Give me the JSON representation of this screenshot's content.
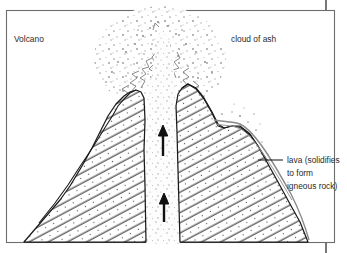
{
  "diagram": {
    "title_label": "Volcano",
    "ash_label": "cloud of ash",
    "lava_label_line1": "lava (solidifies",
    "lava_label_line2": "to form",
    "lava_label_line3": "igneous rock)",
    "colors": {
      "frame": "#6d6d6d",
      "ink": "#1a1a1a",
      "hatch": "#3a3a3a",
      "stipple": "#9a9a9a",
      "text": "#2b2b2b",
      "background": "#ffffff"
    },
    "elements": {
      "vent_channel_name": "volcanic vent",
      "arrow_count": 2,
      "arrow_direction": "up",
      "peak_left_name": "left crater peak",
      "peak_right_name": "right crater peak",
      "lava_flow_name": "lava flow right flank"
    }
  }
}
